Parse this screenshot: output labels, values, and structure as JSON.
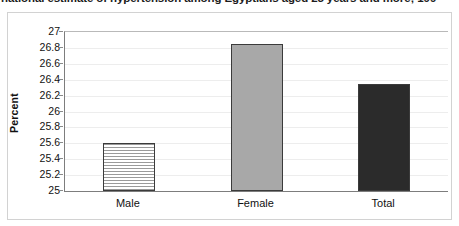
{
  "caption": {
    "text": "national estimate of hypertension among Egyptians aged 25 years and more; 199"
  },
  "chart_data": {
    "type": "bar",
    "title": "",
    "xlabel": "",
    "ylabel": "Percent",
    "categories": [
      "Male",
      "Female",
      "Total"
    ],
    "values": [
      25.6,
      26.85,
      26.35
    ],
    "series": [
      {
        "name": "Hypertension prevalence",
        "values": [
          25.6,
          26.85,
          26.35
        ]
      }
    ],
    "ylim": [
      25,
      27
    ],
    "ytick_step": 0.2,
    "ytick_labels": [
      "27",
      "26.8",
      "26.6",
      "26.4",
      "26.2",
      "26",
      "25.8",
      "25.6",
      "25.4",
      "25.2",
      "25"
    ],
    "ytick_values": [
      27,
      26.8,
      26.6,
      26.4,
      26.2,
      26,
      25.8,
      25.6,
      25.4,
      25.2,
      25
    ],
    "grid": true,
    "legend": "none",
    "bar_styles": [
      "striped",
      "solid",
      "solid"
    ],
    "bar_colors": [
      "#f2f2f2",
      "#a8a8a8",
      "#2b2b2b"
    ],
    "bar_border_color": "#3b3b3b",
    "axis_color": "#7d7d7d",
    "grid_color": "#ededed",
    "frame_color": "#d2d2d2",
    "text_color": "#111111"
  }
}
